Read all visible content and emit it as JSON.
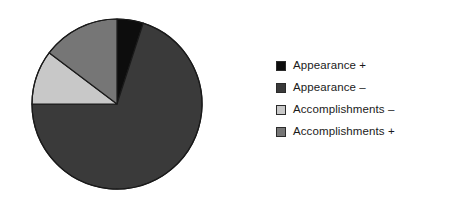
{
  "chart_data": {
    "type": "pie",
    "title": "",
    "subtitle": "",
    "xlabel": "",
    "ylabel": "",
    "grid": false,
    "legend_position": "right",
    "start_angle_deg": 0,
    "direction": "clockwise",
    "categories": [
      "Appearance +",
      "Appearance –",
      "Accomplishments –",
      "Accomplishments +"
    ],
    "values": [
      5,
      70,
      18,
      7
    ],
    "units": "percent",
    "slices": [
      {
        "label": "Appearance +",
        "value": 5,
        "start_deg": 0,
        "end_deg": 18,
        "color": "#0d0d0d"
      },
      {
        "label": "Appearance –",
        "value": 70,
        "start_deg": 18,
        "end_deg": 270,
        "color": "#3a3a3a"
      },
      {
        "label": "Accomplishments –",
        "value": 18,
        "start_deg": 270,
        "end_deg": 307,
        "color": "#c8c8c8"
      },
      {
        "label": "Accomplishments +",
        "value": 7,
        "start_deg": 307,
        "end_deg": 360,
        "color": "#767676"
      }
    ],
    "geometry": {
      "center_x": 117,
      "center_y": 104,
      "radius": 85,
      "outline_color": "#1a1a1a",
      "outline_width": 1.2
    }
  },
  "legend": {
    "items": [
      {
        "label": "Appearance +",
        "color": "#0d0d0d"
      },
      {
        "label": "Appearance –",
        "color": "#3a3a3a"
      },
      {
        "label": "Accomplishments –",
        "color": "#c8c8c8"
      },
      {
        "label": "Accomplishments +",
        "color": "#767676"
      }
    ]
  }
}
